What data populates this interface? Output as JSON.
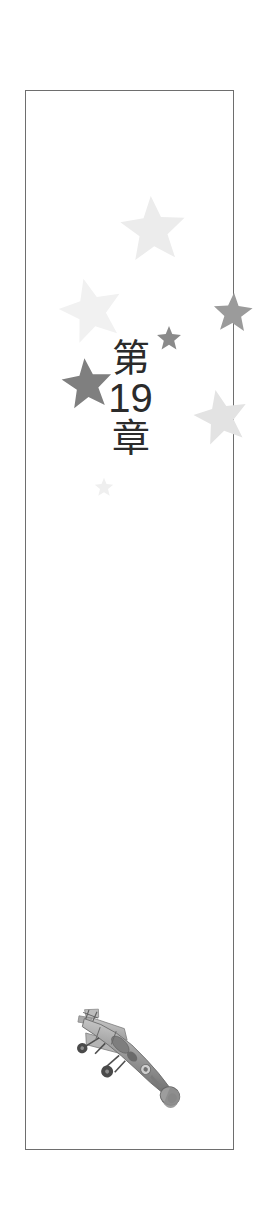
{
  "page": {
    "kind": "book-chapter-title-page",
    "background_color": "#ffffff",
    "width": 261,
    "height": 1221
  },
  "frame": {
    "border_color": "#6e6e6e",
    "border_width": 1.4,
    "left": 25,
    "top": 90,
    "width": 209,
    "height": 1060
  },
  "chapter_title": {
    "full_text": "第19章",
    "reading": "Dai 19 Shou",
    "lines": [
      {
        "text": "第",
        "script": "cjk"
      },
      {
        "text": "19",
        "script": "latin-number"
      },
      {
        "text": "章",
        "script": "cjk"
      }
    ],
    "color": "#2b2b2b",
    "orientation": "vertical"
  },
  "stars": [
    {
      "name": "star-top-center",
      "x": 92,
      "y": 102,
      "size": 70,
      "color": "#ececec",
      "rotation": -4
    },
    {
      "name": "star-mid-left",
      "x": 31,
      "y": 184,
      "size": 68,
      "color": "#f1f1f1",
      "rotation": -14
    },
    {
      "name": "star-right-upper",
      "x": 186,
      "y": 200,
      "size": 42,
      "color": "#9b9b9b",
      "rotation": 3
    },
    {
      "name": "star-small-center",
      "x": 130,
      "y": 234,
      "size": 26,
      "color": "#8a8a8a",
      "rotation": 0
    },
    {
      "name": "star-left-large",
      "x": 34,
      "y": 265,
      "size": 54,
      "color": "#7f7f7f",
      "rotation": -6
    },
    {
      "name": "star-right-lower",
      "x": 166,
      "y": 296,
      "size": 58,
      "color": "#e3e3e3",
      "rotation": -12
    },
    {
      "name": "star-tiny-faint",
      "x": 68,
      "y": 386,
      "size": 20,
      "color": "#efefef",
      "rotation": 0
    }
  ],
  "airplane": {
    "name": "vintage-biplane-illustration",
    "description": "Grayscale vintage propeller airplane viewed from above, nose pointing down-right",
    "body_color": "#9a9a9a",
    "shade_color": "#6d6d6d",
    "highlight_color": "#c9c9c9",
    "wheel_color": "#4a4a4a",
    "left": 28,
    "top": 905,
    "width": 150,
    "height": 120,
    "rotation_deg": 28
  }
}
